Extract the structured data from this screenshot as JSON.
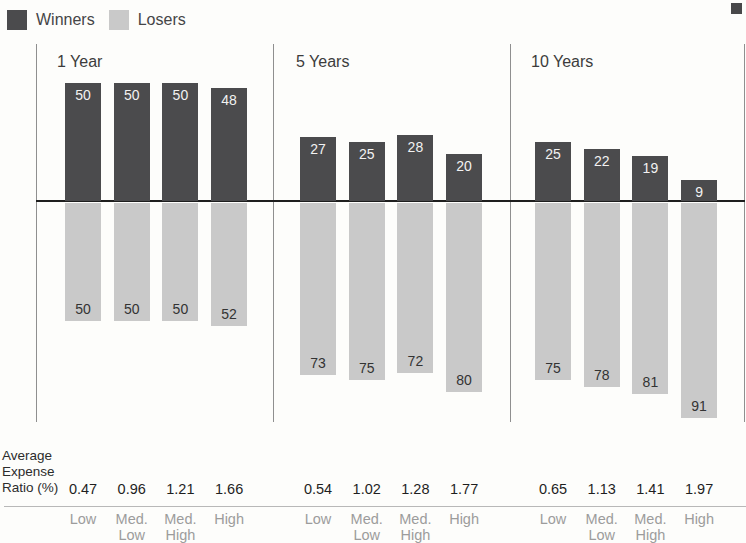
{
  "legend": {
    "items": [
      {
        "label": "Winners",
        "color": "#4b4b4d"
      },
      {
        "label": "Losers",
        "color": "#c9c9c9"
      }
    ]
  },
  "row_label": {
    "lines": [
      "Average",
      "Expense",
      "Ratio (%)"
    ]
  },
  "colors": {
    "winners_bar": "#4b4b4d",
    "losers_bar": "#c9c9c9",
    "zero_line": "#1e1e1e",
    "corner_marker": "#48484a"
  },
  "chart_data": {
    "type": "bar",
    "subtype": "diverging-vertical",
    "unit": "% of funds",
    "legend": [
      "Winners",
      "Losers"
    ],
    "legend_position": "top-left",
    "axis_note": "Winners plotted above the zero line, Losers below; no visible y-axis ticks",
    "value_range_above": [
      0,
      50
    ],
    "value_range_below": [
      0,
      91
    ],
    "categories": [
      "Low",
      "Med. Low",
      "Med. High",
      "High"
    ],
    "groups": [
      {
        "title": "1 Year",
        "winners": [
          50,
          50,
          50,
          48
        ],
        "losers": [
          50,
          50,
          50,
          52
        ],
        "expense_ratios": [
          "0.47",
          "0.96",
          "1.21",
          "1.66"
        ]
      },
      {
        "title": "5 Years",
        "winners": [
          27,
          25,
          28,
          20
        ],
        "losers": [
          73,
          75,
          72,
          80
        ],
        "expense_ratios": [
          "0.54",
          "1.02",
          "1.28",
          "1.77"
        ]
      },
      {
        "title": "10 Years",
        "winners": [
          25,
          22,
          19,
          9
        ],
        "losers": [
          75,
          78,
          81,
          91
        ],
        "expense_ratios": [
          "0.65",
          "1.13",
          "1.41",
          "1.97"
        ]
      }
    ]
  }
}
